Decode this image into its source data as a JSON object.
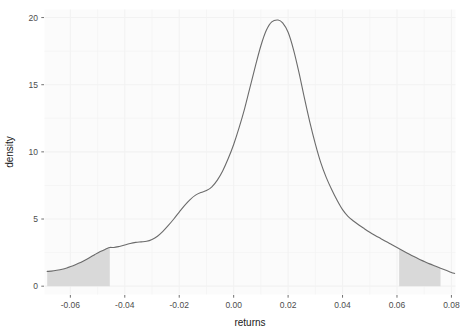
{
  "chart_data": {
    "type": "area",
    "title": "",
    "subtitle": "",
    "xlabel": "returns",
    "ylabel": "density",
    "xlim": [
      -0.0695,
      0.0815
    ],
    "ylim": [
      -0.62,
      20.6
    ],
    "grid": true,
    "legend": null,
    "legend_position": "none",
    "xticks": [
      -0.06,
      -0.04,
      -0.02,
      0.0,
      0.02,
      0.04,
      0.06,
      0.08
    ],
    "xticklabels": [
      "-0.06",
      "-0.04",
      "-0.02",
      "0.00",
      "0.02",
      "0.04",
      "0.06",
      "0.08"
    ],
    "yticks": [
      0,
      5,
      10,
      15,
      20
    ],
    "yticklabels": [
      "0",
      "5",
      "10",
      "15",
      "20"
    ],
    "series": [
      {
        "name": "density",
        "x": [
          -0.0685,
          -0.067,
          -0.065,
          -0.063,
          -0.061,
          -0.059,
          -0.057,
          -0.055,
          -0.053,
          -0.051,
          -0.049,
          -0.047,
          -0.0455,
          -0.044,
          -0.042,
          -0.04,
          -0.038,
          -0.036,
          -0.034,
          -0.032,
          -0.03,
          -0.028,
          -0.026,
          -0.024,
          -0.022,
          -0.02,
          -0.018,
          -0.016,
          -0.014,
          -0.012,
          -0.01,
          -0.008,
          -0.006,
          -0.004,
          -0.002,
          0.0,
          0.002,
          0.004,
          0.006,
          0.008,
          0.01,
          0.012,
          0.014,
          0.0163,
          0.018,
          0.02,
          0.022,
          0.024,
          0.026,
          0.028,
          0.03,
          0.032,
          0.034,
          0.036,
          0.038,
          0.04,
          0.042,
          0.044,
          0.046,
          0.048,
          0.05,
          0.052,
          0.054,
          0.056,
          0.058,
          0.06,
          0.062,
          0.064,
          0.066,
          0.068,
          0.07,
          0.072,
          0.074,
          0.076,
          0.078,
          0.08,
          0.0812
        ],
        "y": [
          1.1,
          1.12,
          1.18,
          1.26,
          1.38,
          1.52,
          1.7,
          1.9,
          2.12,
          2.36,
          2.58,
          2.76,
          2.88,
          2.88,
          2.96,
          3.06,
          3.18,
          3.26,
          3.3,
          3.34,
          3.48,
          3.72,
          4.08,
          4.52,
          5.0,
          5.52,
          6.02,
          6.45,
          6.78,
          6.98,
          7.12,
          7.4,
          7.9,
          8.6,
          9.5,
          10.55,
          11.8,
          13.2,
          14.8,
          16.4,
          17.9,
          19.05,
          19.68,
          19.82,
          19.6,
          18.9,
          17.6,
          15.9,
          14.0,
          12.2,
          10.6,
          9.2,
          8.1,
          7.2,
          6.4,
          5.7,
          5.2,
          4.85,
          4.55,
          4.28,
          4.02,
          3.78,
          3.55,
          3.32,
          3.1,
          2.88,
          2.66,
          2.44,
          2.22,
          2.02,
          1.84,
          1.66,
          1.5,
          1.34,
          1.18,
          1.02,
          0.95
        ]
      }
    ],
    "shaded_regions": [
      {
        "name": "left-tail",
        "x_start": -0.0685,
        "x_end": -0.0455,
        "fill": "#d9d9d9",
        "note": "lower tail region"
      },
      {
        "name": "right-tail",
        "x_start": 0.0608,
        "x_end": 0.076,
        "fill": "#d9d9d9",
        "note": "upper tail region"
      }
    ],
    "style": {
      "line_color": "#6b6b6b",
      "fill_color": "#d9d9d9",
      "panel_background": "#fbfbfb",
      "grid_color": "#f2f2f2",
      "tick_color": "#4d4d4d",
      "axis_text_color": "#4d4d4d",
      "axis_title_color": "#1a1a1a"
    }
  },
  "axes": {
    "x_title": "returns",
    "y_title": "density"
  }
}
